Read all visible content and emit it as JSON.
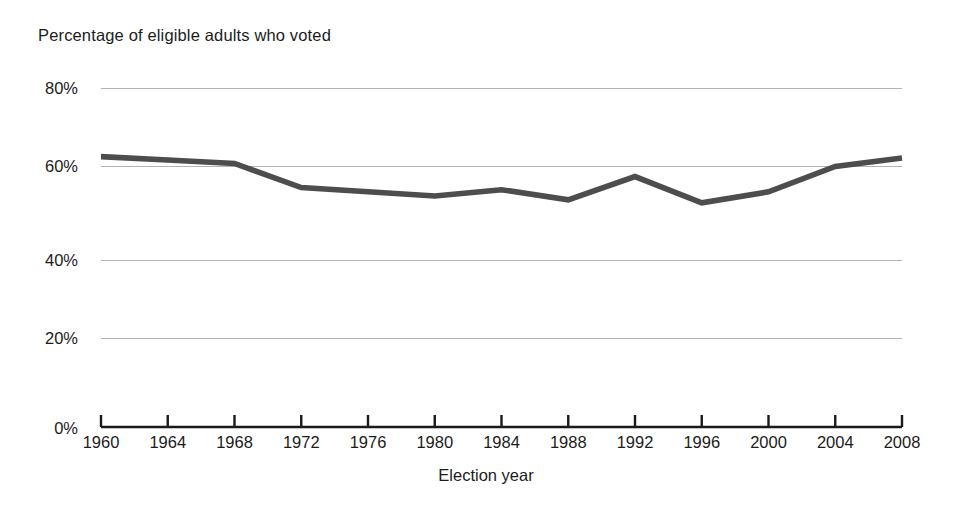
{
  "chart_data": {
    "type": "line",
    "title": "Percentage of eligible adults who voted",
    "xlabel": "Election year",
    "ylabel": "",
    "categories": [
      1960,
      1964,
      1968,
      1972,
      1976,
      1980,
      1984,
      1988,
      1992,
      1996,
      2000,
      2004,
      2008
    ],
    "x_tick_labels": [
      "1960",
      "1964",
      "1968",
      "1972",
      "1976",
      "1980",
      "1984",
      "1988",
      "1992",
      "1996",
      "2000",
      "2004",
      "2008"
    ],
    "values": [
      63.8,
      63.0,
      62.2,
      56.5,
      55.5,
      54.5,
      56.0,
      53.6,
      59.1,
      52.9,
      55.5,
      61.5,
      63.5
    ],
    "y_tick_labels": [
      "0%",
      "20%",
      "40%",
      "60%",
      "80%"
    ],
    "y_tick_values": [
      0,
      20,
      40,
      60,
      80
    ],
    "ylim": [
      0,
      80
    ],
    "xlim": [
      1960,
      2008
    ],
    "grid": true,
    "legend": false,
    "series_color": "#4d4d4d",
    "grid_color": "#b3b3b3",
    "axis_color": "#1a1a1a"
  },
  "axis_labels": {
    "x_title": "Election year"
  }
}
